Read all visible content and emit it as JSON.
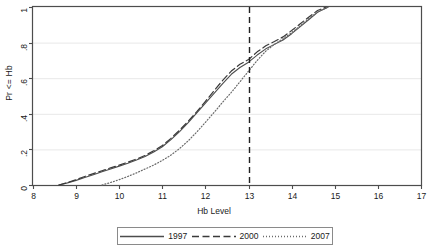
{
  "figure": {
    "clipped_top_text": "",
    "background_color": "#ffffff",
    "plot_border_color": "#4d4d4d",
    "grid_color": "#e8e8e8"
  },
  "chart_data": {
    "type": "line",
    "title": "",
    "xlabel": "Hb Level",
    "ylabel": "Pr <= Hb",
    "xlim": [
      8,
      17
    ],
    "ylim": [
      0,
      1
    ],
    "xticks": [
      8,
      9,
      10,
      11,
      12,
      13,
      14,
      15,
      16,
      17
    ],
    "xticklabels": [
      "8",
      "9",
      "10",
      "11",
      "12",
      "13",
      "14",
      "15",
      "16",
      "17"
    ],
    "yticks": [
      0,
      0.2,
      0.4,
      0.6,
      0.8,
      1
    ],
    "yticklabels": [
      "0",
      ".2",
      ".4",
      ".6",
      ".8",
      "1"
    ],
    "grid": "horizontal",
    "legend_position": "below",
    "reference_lines": [
      {
        "name": "anemia-cutoff",
        "orientation": "vertical",
        "x": 13,
        "style": "dashed",
        "color": "#222222"
      }
    ],
    "series": [
      {
        "name": "1997",
        "style": "solid",
        "color": "#4d4d4d",
        "x": [
          8.6,
          8.8,
          9.0,
          9.2,
          9.4,
          9.6,
          9.8,
          10.0,
          10.2,
          10.4,
          10.6,
          10.8,
          11.0,
          11.2,
          11.4,
          11.6,
          11.8,
          12.0,
          12.2,
          12.4,
          12.6,
          12.8,
          13.0,
          13.2,
          13.4,
          13.6,
          13.8,
          14.0,
          14.2,
          14.4,
          14.6,
          14.85
        ],
        "y": [
          0.0,
          0.012,
          0.026,
          0.042,
          0.058,
          0.074,
          0.09,
          0.106,
          0.122,
          0.14,
          0.16,
          0.185,
          0.215,
          0.255,
          0.3,
          0.35,
          0.405,
          0.46,
          0.515,
          0.57,
          0.622,
          0.66,
          0.69,
          0.73,
          0.765,
          0.79,
          0.815,
          0.85,
          0.89,
          0.93,
          0.97,
          1.0
        ]
      },
      {
        "name": "2000",
        "style": "dashed",
        "color": "#3a3a3a",
        "x": [
          8.6,
          8.8,
          9.0,
          9.2,
          9.4,
          9.6,
          9.8,
          10.0,
          10.2,
          10.4,
          10.6,
          10.8,
          11.0,
          11.2,
          11.4,
          11.6,
          11.8,
          12.0,
          12.2,
          12.4,
          12.6,
          12.8,
          13.0,
          13.2,
          13.4,
          13.6,
          13.8,
          14.0,
          14.2,
          14.4,
          14.6,
          14.8
        ],
        "y": [
          0.0,
          0.014,
          0.03,
          0.048,
          0.064,
          0.08,
          0.096,
          0.112,
          0.128,
          0.146,
          0.166,
          0.192,
          0.222,
          0.262,
          0.308,
          0.358,
          0.412,
          0.47,
          0.53,
          0.588,
          0.64,
          0.678,
          0.705,
          0.748,
          0.782,
          0.806,
          0.832,
          0.868,
          0.906,
          0.944,
          0.98,
          1.0
        ]
      },
      {
        "name": "2007",
        "style": "dotted",
        "color": "#6a6a6a",
        "x": [
          9.6,
          9.8,
          10.0,
          10.2,
          10.4,
          10.6,
          10.8,
          11.0,
          11.2,
          11.4,
          11.6,
          11.8,
          12.0,
          12.2,
          12.4,
          12.6,
          12.8,
          13.0,
          13.2,
          13.4,
          13.6,
          13.8,
          14.0,
          14.2,
          14.4,
          14.6,
          14.85
        ],
        "y": [
          0.0,
          0.014,
          0.03,
          0.048,
          0.068,
          0.09,
          0.112,
          0.138,
          0.168,
          0.205,
          0.248,
          0.298,
          0.352,
          0.408,
          0.465,
          0.52,
          0.58,
          0.64,
          0.7,
          0.752,
          0.79,
          0.822,
          0.856,
          0.895,
          0.935,
          0.972,
          1.0
        ]
      }
    ]
  },
  "legend": {
    "items": [
      {
        "label": "1997",
        "style": "solid"
      },
      {
        "label": "2000",
        "style": "dashed"
      },
      {
        "label": "2007",
        "style": "dotted"
      }
    ]
  }
}
